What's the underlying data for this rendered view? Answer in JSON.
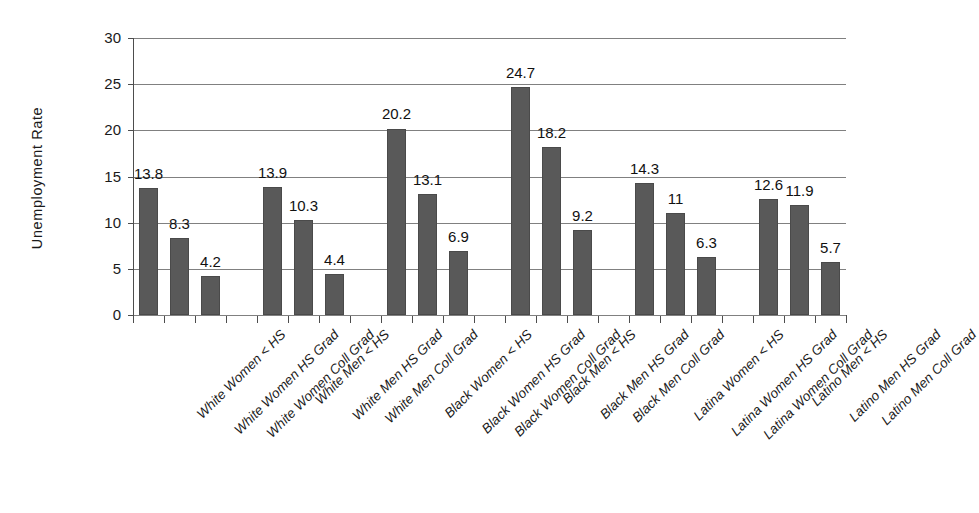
{
  "chart_data": {
    "type": "bar",
    "title": "",
    "xlabel": "",
    "ylabel": "Unemployment Rate",
    "ylim": [
      0,
      30
    ],
    "ytick_values": [
      0,
      5,
      10,
      15,
      20,
      25,
      30
    ],
    "ytick_labels": [
      "0",
      "5",
      "10",
      "15",
      "20",
      "25",
      "30"
    ],
    "grid": "horizontal",
    "legend": "none",
    "bar_color": "#595959",
    "categories": [
      "White Women < HS",
      "White Women HS Grad",
      "White Women Coll Grad",
      "White Men < HS",
      "White Men HS Grad",
      "White Men Coll Grad",
      "Black Women < HS",
      "Black Women HS Grad",
      "Black Women Coll Grad",
      "Black Men < HS",
      "Black Men HS Grad",
      "Black Men Coll Grad",
      "Latina Women < HS",
      "Latina Women HS Grad",
      "Latina Women Coll Grad",
      "Latino Men < HS",
      "Latino Men HS Grad",
      "Latino Men Coll Grad"
    ],
    "values": [
      13.8,
      8.3,
      4.2,
      13.9,
      10.3,
      4.4,
      20.2,
      13.1,
      6.9,
      24.7,
      18.2,
      9.2,
      14.3,
      11,
      6.3,
      12.6,
      11.9,
      5.7
    ],
    "value_labels": [
      "13.8",
      "8.3",
      "4.2",
      "13.9",
      "10.3",
      "4.4",
      "20.2",
      "13.1",
      "6.9",
      "24.7",
      "18.2",
      "9.2",
      "14.3",
      "11",
      "6.3",
      "12.6",
      "11.9",
      "5.7"
    ],
    "groups": [
      {
        "name": "White Women",
        "indices": [
          0,
          1,
          2
        ]
      },
      {
        "name": "White Men",
        "indices": [
          3,
          4,
          5
        ]
      },
      {
        "name": "Black Women",
        "indices": [
          6,
          7,
          8
        ]
      },
      {
        "name": "Black Men",
        "indices": [
          9,
          10,
          11
        ]
      },
      {
        "name": "Latina Women",
        "indices": [
          12,
          13,
          14
        ]
      },
      {
        "name": "Latino Men",
        "indices": [
          15,
          16,
          17
        ]
      }
    ]
  }
}
